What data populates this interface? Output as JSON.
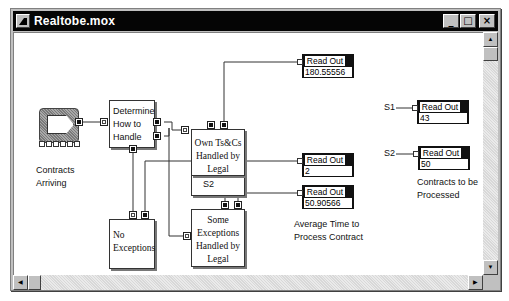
{
  "window": {
    "title": "Realtobe.mox",
    "controls": {
      "minimize": "_",
      "maximize": "□",
      "close": "×"
    }
  },
  "blocks": {
    "generator": {
      "label_line1": "Contracts",
      "label_line2": "Arriving"
    },
    "determine": {
      "line1": "Determine",
      "line2": "How to",
      "line3": "Handle"
    },
    "own_tcs": {
      "line1": "Own Ts&Cs",
      "line2": "Handled by",
      "line3": "Legal",
      "signal": "S1"
    },
    "no_exceptions": {
      "line1": "No",
      "line2": "Exceptions"
    },
    "some_exceptions": {
      "line1": "Some",
      "line2": "Exceptions",
      "line3": "Handled by",
      "line4": "Legal",
      "signal": "S2"
    }
  },
  "readouts": [
    {
      "header": "Read Out",
      "value": "180.55556"
    },
    {
      "header": "Read Out",
      "value": "2"
    },
    {
      "header": "Read Out",
      "value": "50.90566"
    },
    {
      "header": "Read Out",
      "value": "43",
      "signal": "S1"
    },
    {
      "header": "Read Out",
      "value": "50",
      "signal": "S2"
    }
  ],
  "labels": {
    "avg_time_line1": "Average Time to",
    "avg_time_line2": "Process Contract",
    "to_process_line1": "Contracts to be",
    "to_process_line2": "Processed"
  },
  "scrollbars": {
    "up_arrow": "▲",
    "down_arrow": "▼",
    "left_arrow": "◀",
    "right_arrow": "▶"
  }
}
